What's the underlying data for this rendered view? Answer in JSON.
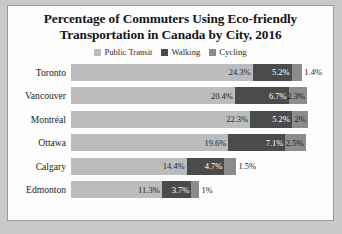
{
  "chart_data": {
    "type": "bar",
    "subtype": "stacked-horizontal",
    "title": "Percentage of Commuters Using Eco-friendly Transportation in Canada by City, 2016",
    "title_lines": [
      "Percentage of Commuters Using Eco-friendly",
      "Transportation in Canada by City, 2016"
    ],
    "xlabel": "",
    "ylabel": "",
    "grid": false,
    "legend_position": "top",
    "axis_visible": false,
    "xlim": [
      0,
      31.5
    ],
    "categories": [
      "Toronto",
      "Vancouver",
      "Montréal",
      "Ottawa",
      "Calgary",
      "Edmonton"
    ],
    "series": [
      {
        "name": "Public Transit",
        "color": "#bcbcbc",
        "values": [
          24.3,
          20.4,
          22.3,
          19.6,
          14.4,
          11.3
        ],
        "labels": [
          "24.3%",
          "20.4%",
          "22.3%",
          "19.6%",
          "14.4%",
          "11.3%"
        ]
      },
      {
        "name": "Walking",
        "color": "#4b4b4b",
        "values": [
          5.2,
          6.7,
          5.2,
          7.1,
          4.7,
          3.7
        ],
        "labels": [
          "5.2%",
          "6.7%",
          "5.2%",
          "7.1%",
          "4.7%",
          "3.7%"
        ]
      },
      {
        "name": "Cycling",
        "color": "#8c8c8c",
        "values": [
          1.4,
          2.3,
          2.0,
          2.5,
          1.5,
          1.0
        ],
        "labels": [
          "1.4%",
          "2.3%",
          "2%",
          "2.5%",
          "1.5%",
          "1%"
        ]
      }
    ],
    "totals": [
      30.9,
      29.4,
      29.5,
      29.2,
      20.6,
      16.0
    ]
  },
  "legend": {
    "items": [
      {
        "label": "Public Transit",
        "color": "#bcbcbc"
      },
      {
        "label": "Walking",
        "color": "#4b4b4b"
      },
      {
        "label": "Cycling",
        "color": "#8c8c8c"
      }
    ]
  },
  "colors": {
    "page_background": "#c9c9c9",
    "chart_background": "#fdfdfd",
    "border": "#9a9a9a",
    "title_text": "#161616",
    "label_text": "#1c1c1c",
    "walking_label_text": "#ffffff"
  }
}
